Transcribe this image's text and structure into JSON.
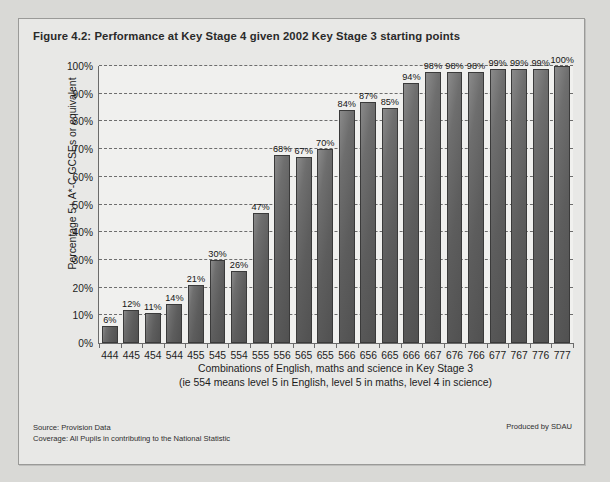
{
  "figure": {
    "title": "Figure 4.2: Performance at Key Stage 4 given 2002 Key Stage 3 starting points",
    "source_line": "Source: Provision Data",
    "coverage_line": "Coverage: All Pupils in contributing to the National Statistic",
    "produced_by": "Produced by SDAU",
    "background_color": "#e8e8e6",
    "plot_background_color": "#f0f0ee",
    "bar_color": "#5d5d5d",
    "axis_color": "#6b6b6b"
  },
  "chart_data": {
    "type": "bar",
    "title": "Figure 4.2: Performance at Key Stage 4 given 2002 Key Stage 3 starting points",
    "xlabel": "Combinations of English, maths and science in Key Stage 3",
    "xlabel_note": "(ie 554 means level 5 in English, level 5 in maths, level 4 in science)",
    "ylabel": "Percentage 5+ A*-C GCSEs or equivalent",
    "ylim": [
      0,
      100
    ],
    "ytick_labels": [
      "0%",
      "10%",
      "20%",
      "30%",
      "40%",
      "50%",
      "60%",
      "70%",
      "80%",
      "90%",
      "100%"
    ],
    "yticks": [
      0,
      10,
      20,
      30,
      40,
      50,
      60,
      70,
      80,
      90,
      100
    ],
    "grid": true,
    "legend": false,
    "categories": [
      "444",
      "445",
      "454",
      "544",
      "455",
      "545",
      "554",
      "555",
      "556",
      "565",
      "655",
      "566",
      "656",
      "665",
      "666",
      "667",
      "676",
      "766",
      "677",
      "767",
      "776",
      "777"
    ],
    "values": [
      6,
      12,
      11,
      14,
      21,
      30,
      26,
      47,
      68,
      67,
      70,
      84,
      87,
      85,
      94,
      98,
      98,
      98,
      99,
      99,
      99,
      100
    ],
    "data_labels": [
      "6%",
      "12%",
      "11%",
      "14%",
      "21%",
      "30%",
      "26%",
      "47%",
      "68%",
      "67%",
      "70%",
      "84%",
      "87%",
      "85%",
      "94%",
      "98%",
      "98%",
      "98%",
      "99%",
      "99%",
      "99%",
      "100%"
    ]
  }
}
